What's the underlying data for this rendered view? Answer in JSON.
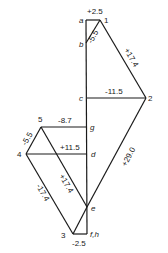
{
  "diagram": {
    "type": "force polygon (Maxwell diagram)",
    "points": {
      "a": {
        "label": "a",
        "x": 86,
        "y": 20
      },
      "p1": {
        "label": "1",
        "x": 100,
        "y": 20
      },
      "b": {
        "label": "b",
        "x": 86,
        "y": 43
      },
      "c": {
        "label": "c",
        "x": 87,
        "y": 98
      },
      "p2": {
        "label": "2",
        "x": 146,
        "y": 98
      },
      "p5": {
        "label": "5",
        "x": 41,
        "y": 127
      },
      "g": {
        "label": "g",
        "x": 87,
        "y": 127
      },
      "p4": {
        "label": "4",
        "x": 26,
        "y": 154
      },
      "d": {
        "label": "d",
        "x": 87,
        "y": 154
      },
      "e": {
        "label": "e",
        "x": 87,
        "y": 207
      },
      "p3": {
        "label": "3",
        "x": 73,
        "y": 234
      },
      "fh": {
        "label": "f,h",
        "x": 87,
        "y": 234
      }
    },
    "members": [
      {
        "from": "a",
        "to": "p1",
        "value": "+2.5"
      },
      {
        "from": "b",
        "to": "p1",
        "value": "-5.5"
      },
      {
        "from": "p1",
        "to": "p2",
        "value": "+17.4"
      },
      {
        "from": "c",
        "to": "p2",
        "value": "-11.5"
      },
      {
        "from": "p2",
        "to": "e",
        "value": "+29.0"
      },
      {
        "from": "p5",
        "to": "g",
        "value": "-8.7"
      },
      {
        "from": "p4",
        "to": "p5",
        "value": "-5.5"
      },
      {
        "from": "p4",
        "to": "d",
        "value": "+11.5"
      },
      {
        "from": "p5",
        "to": "e",
        "value": "+17.4"
      },
      {
        "from": "p4",
        "to": "p3",
        "value": "-17.4"
      },
      {
        "from": "p3",
        "to": "fh",
        "value": "-2.5"
      },
      {
        "from": "p3",
        "to": "e",
        "value": ""
      },
      {
        "from": "a",
        "to": "fh",
        "value": ""
      }
    ]
  }
}
